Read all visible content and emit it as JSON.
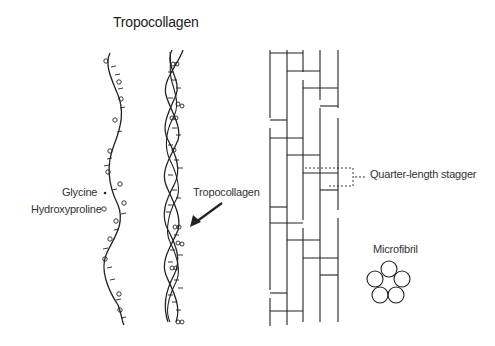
{
  "title": "Tropocollagen",
  "legend": {
    "glycine": "Glycine",
    "hydroxyproline": "Hydroxyproline"
  },
  "labels": {
    "tropocollagen_arrow": "Tropocollagen",
    "quarter_stagger": "Quarter-length stagger",
    "microfibril": "Microfibril"
  },
  "colors": {
    "stroke": "#222222",
    "background": "#ffffff"
  }
}
